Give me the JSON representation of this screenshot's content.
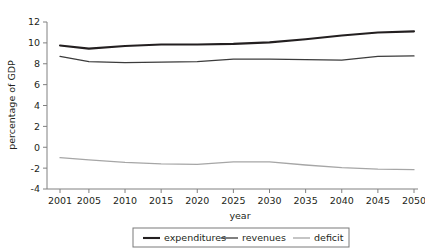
{
  "chart_data": {
    "type": "line",
    "title": "",
    "xlabel": "year",
    "ylabel": "percentage of GDP",
    "x": [
      2001,
      2005,
      2010,
      2015,
      2020,
      2025,
      2030,
      2035,
      2040,
      2045,
      2050
    ],
    "xtick_labels": [
      "2001",
      "2005",
      "2010",
      "2015",
      "2020",
      "2025",
      "2030",
      "2035",
      "2040",
      "2045",
      "2050"
    ],
    "xlim": [
      2001,
      2050
    ],
    "ylim": [
      -4,
      12
    ],
    "ytick_labels": [
      "12",
      "10",
      "8",
      "6",
      "4",
      "2",
      "0",
      "-2",
      "-4"
    ],
    "ytick_values": [
      12,
      10,
      8,
      6,
      4,
      2,
      0,
      -2,
      -4
    ],
    "grid": false,
    "legend_position": "bottom",
    "series": [
      {
        "name": "expenditures",
        "color": "#231f20",
        "width": 2.1,
        "values": [
          9.75,
          9.45,
          9.7,
          9.85,
          9.85,
          9.9,
          10.05,
          10.35,
          10.7,
          11.0,
          11.1
        ]
      },
      {
        "name": "revenues",
        "color": "#3c3c3c",
        "width": 1.3,
        "values": [
          8.7,
          8.2,
          8.1,
          8.15,
          8.2,
          8.45,
          8.45,
          8.4,
          8.35,
          8.7,
          8.75
        ]
      },
      {
        "name": "deficit",
        "color": "#a6a6a6",
        "width": 1.3,
        "values": [
          -1.0,
          -1.2,
          -1.45,
          -1.6,
          -1.65,
          -1.4,
          -1.4,
          -1.7,
          -1.95,
          -2.1,
          -2.15
        ]
      }
    ]
  },
  "legend": {
    "items": [
      {
        "label": "expenditures",
        "color": "#231f20",
        "width": 2.1
      },
      {
        "label": "revenues",
        "color": "#3c3c3c",
        "width": 1.3
      },
      {
        "label": "deficit",
        "color": "#a6a6a6",
        "width": 1.3
      }
    ]
  },
  "axes": {
    "axis_color": "#808080",
    "x_axis_title": "year",
    "y_axis_title": "percentage of GDP"
  }
}
